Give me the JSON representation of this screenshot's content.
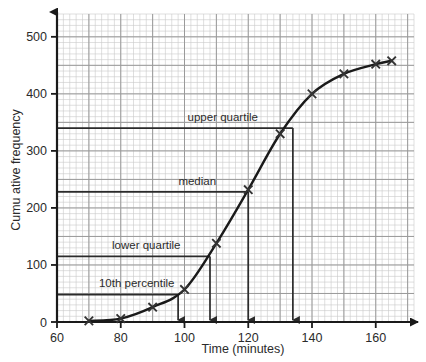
{
  "chart_data": {
    "type": "line",
    "title": "",
    "xlabel": "Time (minutes)",
    "ylabel": "Cumu ative frequency",
    "xlim": [
      60,
      172
    ],
    "ylim": [
      0,
      540
    ],
    "xticks": [
      60,
      80,
      100,
      120,
      140,
      160
    ],
    "xtick_labels": [
      "60",
      "80",
      "100",
      "120",
      "140",
      "160"
    ],
    "yticks": [
      0,
      100,
      200,
      300,
      400,
      500
    ],
    "ytick_labels": [
      "0",
      "100",
      "200",
      "300",
      "400",
      "500"
    ],
    "grid": "graph-paper minor every 2 units x / 10 units y, major every 10 units x / 50 units y",
    "legend": "none",
    "x": [
      70,
      80,
      90,
      100,
      110,
      120,
      130,
      140,
      150,
      160,
      165
    ],
    "y": [
      2,
      6,
      26,
      57,
      138,
      232,
      330,
      400,
      435,
      452,
      458
    ],
    "series": [
      {
        "name": "Cumulative frequency",
        "marker": "cross",
        "values": [
          2,
          6,
          26,
          57,
          138,
          232,
          330,
          400,
          435,
          452,
          458
        ]
      }
    ],
    "annotations": [
      {
        "name": "upper-quartile",
        "label": "upper quartile",
        "y_value": 340,
        "x_value": 134,
        "label_x": 112,
        "label_y": 352
      },
      {
        "name": "median",
        "label": "median",
        "y_value": 228,
        "x_value": 120,
        "label_x": 104,
        "label_y": 241
      },
      {
        "name": "lower-quartile",
        "label": "lower quartile",
        "y_value": 115,
        "x_value": 108,
        "label_x": 88,
        "label_y": 128
      },
      {
        "name": "tenth-percentile",
        "label": "10th percentile",
        "y_value": 48,
        "x_value": 98,
        "label_x": 85,
        "label_y": 61
      }
    ]
  },
  "colors": {
    "curve": "#1a1a1a",
    "axis": "#1a1a1a",
    "annotation_line": "#2b2b2b",
    "grid_minor": "#c9c9c9",
    "grid_major": "#9a9a9a",
    "background": "#ffffff",
    "text": "#2b2b2b"
  }
}
